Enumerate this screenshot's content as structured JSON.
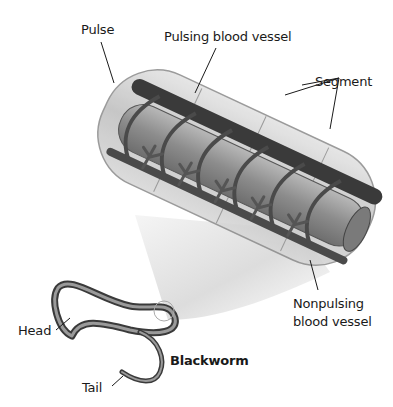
{
  "figure": {
    "subject": "Blackworm",
    "labels": {
      "pulse": "Pulse",
      "pulsing_vessel": "Pulsing blood vessel",
      "segment": "Segment",
      "nonpulsing_line1": "Nonpulsing",
      "nonpulsing_line2": "blood vessel",
      "head": "Head",
      "tail": "Tail",
      "blackworm": "Blackworm"
    },
    "colors": {
      "background": "#ffffff",
      "body_translucent": "#c9c9c9",
      "vessel_dark": "#3a3a3a",
      "gut": "#9a9a9a",
      "magnifier_cone": "#d8d8d8",
      "text": "#1a1a1a"
    }
  }
}
